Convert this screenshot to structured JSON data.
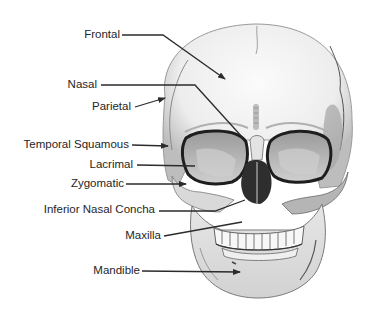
{
  "diagram": {
    "labels": [
      {
        "id": "frontal",
        "text": "Frontal",
        "right": 121,
        "y": 35,
        "line": [
          [
            122,
            35
          ],
          [
            163,
            35
          ],
          [
            225,
            79
          ]
        ],
        "arrow": true
      },
      {
        "id": "nasal",
        "text": "Nasal",
        "right": 98,
        "y": 85,
        "line": [
          [
            101,
            85
          ],
          [
            195,
            85
          ],
          [
            243,
            138
          ]
        ],
        "arrow": false
      },
      {
        "id": "parietal",
        "text": "Parietal",
        "right": 132,
        "y": 107,
        "line": [
          [
            135,
            107
          ],
          [
            165,
            98
          ]
        ],
        "arrow": true
      },
      {
        "id": "temporal-squamous",
        "text": "Temporal Squamous",
        "right": 130,
        "y": 145,
        "line": [
          [
            132,
            145
          ],
          [
            168,
            146
          ]
        ],
        "arrow": true
      },
      {
        "id": "lacrimal",
        "text": "Lacrimal",
        "right": 134,
        "y": 165,
        "line": [
          [
            137,
            165
          ],
          [
            195,
            166
          ]
        ],
        "arrow": false
      },
      {
        "id": "zygomatic",
        "text": "Zygomatic",
        "right": 125,
        "y": 184,
        "line": [
          [
            126,
            184
          ],
          [
            186,
            184
          ]
        ],
        "arrow": true
      },
      {
        "id": "inferior-nasal-concha",
        "text": "Inferior Nasal Concha",
        "right": 156,
        "y": 210,
        "line": [
          [
            159,
            211
          ],
          [
            215,
            211
          ],
          [
            245,
            200
          ]
        ],
        "arrow": false
      },
      {
        "id": "maxilla",
        "text": "Maxilla",
        "right": 162,
        "y": 236,
        "line": [
          [
            164,
            236
          ],
          [
            242,
            222
          ]
        ],
        "arrow": false
      },
      {
        "id": "mandible",
        "text": "Mandible",
        "right": 141,
        "y": 271,
        "line": [
          [
            142,
            271
          ],
          [
            240,
            272
          ]
        ],
        "arrow": true
      }
    ]
  },
  "colors": {
    "text": "#262626",
    "leader": "#2b2b2b",
    "bone_light": "#f2f2f2",
    "bone_mid": "#c8c8c8",
    "bone_dark": "#6e6e6e",
    "cavity": "#3a3a3a"
  }
}
